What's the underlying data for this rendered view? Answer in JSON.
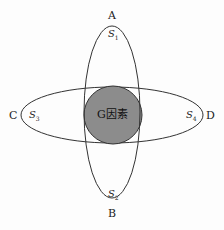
{
  "diagram": {
    "points": {
      "top": "A",
      "bottom": "B",
      "left": "C",
      "right": "D"
    },
    "regions": {
      "top": {
        "base": "S",
        "sub": "1"
      },
      "bottom": {
        "base": "S",
        "sub": "2"
      },
      "left": {
        "base": "S",
        "sub": "3"
      },
      "right": {
        "base": "S",
        "sub": "4"
      }
    },
    "center": "G因素",
    "colors": {
      "center_fill": "#8c8c8c",
      "stroke": "#333333"
    }
  }
}
